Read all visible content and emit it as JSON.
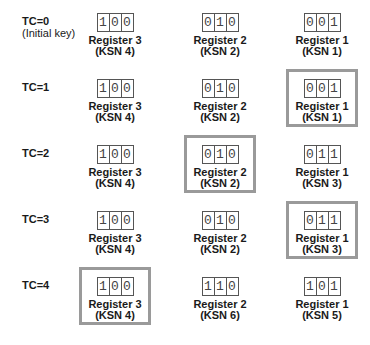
{
  "rows": [
    {
      "label": "TC=0",
      "sublabel": "(Initial key)",
      "registers": [
        {
          "name": "Register 3",
          "ksn": "(KSN 4)",
          "bits": [
            "1",
            "0",
            "0"
          ],
          "highlighted": false
        },
        {
          "name": "Register 2",
          "ksn": "(KSN 2)",
          "bits": [
            "0",
            "1",
            "0"
          ],
          "highlighted": false
        },
        {
          "name": "Register 1",
          "ksn": "(KSN 1)",
          "bits": [
            "0",
            "0",
            "1"
          ],
          "highlighted": false
        }
      ]
    },
    {
      "label": "TC=1",
      "sublabel": "",
      "registers": [
        {
          "name": "Register 3",
          "ksn": "(KSN 4)",
          "bits": [
            "1",
            "0",
            "0"
          ],
          "highlighted": false
        },
        {
          "name": "Register 2",
          "ksn": "(KSN 2)",
          "bits": [
            "0",
            "1",
            "0"
          ],
          "highlighted": false
        },
        {
          "name": "Register 1",
          "ksn": "(KSN 1)",
          "bits": [
            "0",
            "0",
            "1"
          ],
          "highlighted": true
        }
      ]
    },
    {
      "label": "TC=2",
      "sublabel": "",
      "registers": [
        {
          "name": "Register 3",
          "ksn": "(KSN 4)",
          "bits": [
            "1",
            "0",
            "0"
          ],
          "highlighted": false
        },
        {
          "name": "Register 2",
          "ksn": "(KSN 2)",
          "bits": [
            "0",
            "1",
            "0"
          ],
          "highlighted": true
        },
        {
          "name": "Register 1",
          "ksn": "(KSN 3)",
          "bits": [
            "0",
            "1",
            "1"
          ],
          "highlighted": false
        }
      ]
    },
    {
      "label": "TC=3",
      "sublabel": "",
      "registers": [
        {
          "name": "Register 3",
          "ksn": "(KSN 4)",
          "bits": [
            "1",
            "0",
            "0"
          ],
          "highlighted": false
        },
        {
          "name": "Register 2",
          "ksn": "(KSN 2)",
          "bits": [
            "0",
            "1",
            "0"
          ],
          "highlighted": false
        },
        {
          "name": "Register 1",
          "ksn": "(KSN 3)",
          "bits": [
            "0",
            "1",
            "1"
          ],
          "highlighted": true
        }
      ]
    },
    {
      "label": "TC=4",
      "sublabel": "",
      "registers": [
        {
          "name": "Register 3",
          "ksn": "(KSN 4)",
          "bits": [
            "1",
            "0",
            "0"
          ],
          "highlighted": true
        },
        {
          "name": "Register 2",
          "ksn": "(KSN 6)",
          "bits": [
            "1",
            "1",
            "0"
          ],
          "highlighted": false
        },
        {
          "name": "Register 1",
          "ksn": "(KSN 5)",
          "bits": [
            "1",
            "0",
            "1"
          ],
          "highlighted": false
        }
      ]
    }
  ],
  "colors": {
    "highlight_frame": "#9a9a9a",
    "digit_border": "#555555",
    "text": "#1a1a1a"
  }
}
